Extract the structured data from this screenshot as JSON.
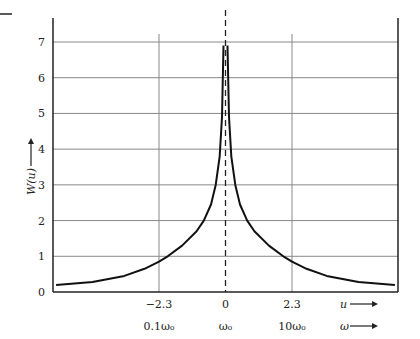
{
  "chart_data": {
    "type": "line",
    "title": "",
    "xlabel": "u",
    "xlabel2": "ω",
    "ylabel": "W(u)",
    "ylim": [
      0,
      7
    ],
    "xlim": [
      -5.86,
      5.86
    ],
    "grid": true,
    "y_ticks": [
      "0",
      "1",
      "2",
      "3",
      "4",
      "5",
      "6",
      "7"
    ],
    "x_ticks": [
      {
        "u": -2.3,
        "label": "−2.3",
        "omega_label": "0.1ω₀"
      },
      {
        "u": 0,
        "label": "0",
        "omega_label": "ω₀"
      },
      {
        "u": 2.3,
        "label": "2.3",
        "omega_label": "10ω₀"
      }
    ],
    "center_dashed_line": {
      "u": 0
    },
    "series": [
      {
        "name": "W(u)",
        "x": [
          -5.86,
          -4.6,
          -3.5,
          -2.8,
          -2.3,
          -2.0,
          -1.5,
          -1.0,
          -0.75,
          -0.5,
          -0.34,
          -0.2,
          -0.12,
          -0.07,
          0.07,
          0.12,
          0.2,
          0.34,
          0.5,
          0.75,
          1.0,
          1.5,
          2.0,
          2.3,
          2.8,
          3.5,
          4.6,
          5.86
        ],
        "values": [
          0.2,
          0.28,
          0.45,
          0.65,
          0.85,
          1.0,
          1.3,
          1.7,
          2.0,
          2.45,
          3.0,
          3.8,
          4.9,
          6.9,
          6.9,
          4.9,
          3.8,
          3.0,
          2.45,
          2.0,
          1.7,
          1.3,
          1.0,
          0.85,
          0.65,
          0.45,
          0.28,
          0.2
        ]
      }
    ]
  },
  "labels": {
    "ylabel": "W(u)",
    "x_axis_u": "u",
    "x_axis_omega": "ω"
  }
}
